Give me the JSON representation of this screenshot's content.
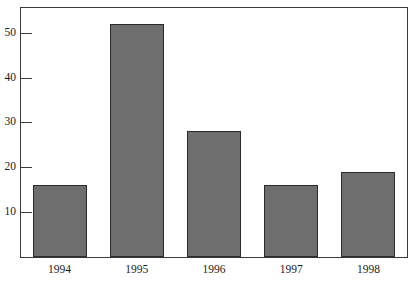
{
  "chart_data": {
    "type": "bar",
    "title": "",
    "subtitle": "",
    "xlabel": "",
    "ylabel": "",
    "categories": [
      "1994",
      "1995",
      "1996",
      "1997",
      "1998"
    ],
    "values": [
      16,
      52,
      28,
      16,
      19
    ],
    "yticks": [
      10,
      20,
      30,
      40,
      50
    ],
    "ylim": [
      0,
      55.5
    ],
    "grid": false,
    "legend": null,
    "legend_position": "none",
    "annotations": [],
    "colors": {
      "bar_fill": "#6e6e6e",
      "bar_stroke": "#2b2b2b",
      "axis": "#3a3a3a",
      "text": "#1a1a1a",
      "background": "#ffffff"
    }
  }
}
